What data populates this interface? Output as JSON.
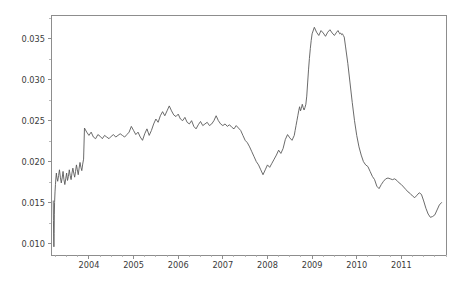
{
  "chart_data": {
    "type": "line",
    "title": "",
    "subtitle": "",
    "xlabel": "",
    "ylabel": "",
    "legend": [],
    "grid": false,
    "xlim": [
      2003.15,
      2012.0
    ],
    "ylim": [
      0.0086,
      0.0379
    ],
    "x_ticks": [
      2004,
      2005,
      2006,
      2007,
      2008,
      2009,
      2010,
      2011
    ],
    "x_tick_labels": [
      "2004",
      "2005",
      "2006",
      "2007",
      "2008",
      "2009",
      "2010",
      "2011"
    ],
    "x_minor_ticks_per_interval": 4,
    "y_ticks": [
      0.01,
      0.015,
      0.02,
      0.025,
      0.03,
      0.035
    ],
    "y_tick_labels": [
      "0.010",
      "0.015",
      "0.020",
      "0.025",
      "0.030",
      "0.035"
    ],
    "y_minor_ticks_per_interval": 2,
    "line_color": "#5a5a5a",
    "axis_color": "#8d8d8d",
    "background_color": "#ffffff",
    "series": [
      {
        "name": "series-1",
        "x": [
          2003.2,
          2003.205,
          2003.21,
          2003.215,
          2003.22,
          2003.225,
          2003.23,
          2003.24,
          2003.25,
          2003.26,
          2003.27,
          2003.28,
          2003.3,
          2003.32,
          2003.34,
          2003.36,
          2003.38,
          2003.4,
          2003.42,
          2003.44,
          2003.46,
          2003.48,
          2003.5,
          2003.52,
          2003.54,
          2003.56,
          2003.58,
          2003.6,
          2003.62,
          2003.64,
          2003.66,
          2003.68,
          2003.7,
          2003.72,
          2003.74,
          2003.76,
          2003.78,
          2003.8,
          2003.82,
          2003.84,
          2003.86,
          2003.88,
          2003.9,
          2003.95,
          2004.0,
          2004.05,
          2004.1,
          2004.15,
          2004.2,
          2004.25,
          2004.3,
          2004.35,
          2004.4,
          2004.45,
          2004.5,
          2004.55,
          2004.6,
          2004.65,
          2004.7,
          2004.75,
          2004.8,
          2004.85,
          2004.9,
          2004.95,
          2005.0,
          2005.05,
          2005.1,
          2005.15,
          2005.2,
          2005.25,
          2005.3,
          2005.35,
          2005.4,
          2005.45,
          2005.5,
          2005.55,
          2005.6,
          2005.65,
          2005.7,
          2005.75,
          2005.8,
          2005.85,
          2005.9,
          2005.95,
          2006.0,
          2006.05,
          2006.1,
          2006.15,
          2006.2,
          2006.25,
          2006.3,
          2006.35,
          2006.4,
          2006.45,
          2006.5,
          2006.55,
          2006.6,
          2006.65,
          2006.7,
          2006.75,
          2006.8,
          2006.85,
          2006.9,
          2006.95,
          2007.0,
          2007.05,
          2007.1,
          2007.15,
          2007.2,
          2007.25,
          2007.3,
          2007.35,
          2007.4,
          2007.45,
          2007.5,
          2007.55,
          2007.6,
          2007.65,
          2007.7,
          2007.75,
          2007.8,
          2007.85,
          2007.9,
          2007.95,
          2008.0,
          2008.05,
          2008.1,
          2008.15,
          2008.2,
          2008.25,
          2008.3,
          2008.35,
          2008.4,
          2008.45,
          2008.5,
          2008.55,
          2008.6,
          2008.62,
          2008.64,
          2008.66,
          2008.68,
          2008.7,
          2008.72,
          2008.74,
          2008.76,
          2008.78,
          2008.8,
          2008.82,
          2008.84,
          2008.86,
          2008.88,
          2008.9,
          2008.92,
          2008.94,
          2008.96,
          2008.98,
          2009.0,
          2009.05,
          2009.1,
          2009.15,
          2009.2,
          2009.25,
          2009.3,
          2009.35,
          2009.4,
          2009.45,
          2009.5,
          2009.55,
          2009.58,
          2009.6,
          2009.62,
          2009.64,
          2009.66,
          2009.68,
          2009.7,
          2009.72,
          2009.75,
          2009.8,
          2009.85,
          2009.9,
          2009.95,
          2010.0,
          2010.05,
          2010.1,
          2010.15,
          2010.2,
          2010.25,
          2010.3,
          2010.35,
          2010.4,
          2010.45,
          2010.5,
          2010.55,
          2010.6,
          2010.65,
          2010.7,
          2010.75,
          2010.8,
          2010.85,
          2010.9,
          2010.95,
          2011.0,
          2011.05,
          2011.1,
          2011.15,
          2011.2,
          2011.25,
          2011.3,
          2011.35,
          2011.4,
          2011.45,
          2011.5,
          2011.55,
          2011.6,
          2011.65,
          2011.7,
          2011.75,
          2011.8,
          2011.85,
          2011.9
        ],
        "y": [
          0.0152,
          0.0128,
          0.0108,
          0.0096,
          0.0112,
          0.0135,
          0.015,
          0.0163,
          0.0172,
          0.018,
          0.0186,
          0.0181,
          0.0176,
          0.0183,
          0.019,
          0.0181,
          0.0174,
          0.018,
          0.0188,
          0.0178,
          0.0172,
          0.0179,
          0.0186,
          0.0177,
          0.0182,
          0.019,
          0.0183,
          0.0178,
          0.0186,
          0.0192,
          0.0186,
          0.0181,
          0.0188,
          0.0196,
          0.019,
          0.0184,
          0.0192,
          0.0199,
          0.0193,
          0.0189,
          0.0197,
          0.0203,
          0.0241,
          0.0236,
          0.0232,
          0.0236,
          0.023,
          0.0228,
          0.0233,
          0.0231,
          0.0228,
          0.0232,
          0.023,
          0.0228,
          0.0231,
          0.0233,
          0.023,
          0.0232,
          0.0234,
          0.0232,
          0.023,
          0.0233,
          0.0236,
          0.0243,
          0.0238,
          0.0233,
          0.0236,
          0.023,
          0.0226,
          0.0234,
          0.024,
          0.0232,
          0.0238,
          0.0246,
          0.0252,
          0.0248,
          0.0256,
          0.0261,
          0.0256,
          0.0262,
          0.0268,
          0.0262,
          0.0257,
          0.0255,
          0.0258,
          0.0252,
          0.025,
          0.0254,
          0.0248,
          0.0246,
          0.025,
          0.0243,
          0.024,
          0.0245,
          0.0249,
          0.0244,
          0.0246,
          0.0248,
          0.0244,
          0.0246,
          0.025,
          0.0256,
          0.025,
          0.0246,
          0.0244,
          0.0246,
          0.0243,
          0.0245,
          0.0242,
          0.024,
          0.0244,
          0.0241,
          0.0238,
          0.0232,
          0.0226,
          0.0223,
          0.0218,
          0.0212,
          0.0206,
          0.02,
          0.0196,
          0.019,
          0.0184,
          0.019,
          0.0196,
          0.0193,
          0.0198,
          0.0203,
          0.0208,
          0.0214,
          0.021,
          0.0216,
          0.0227,
          0.0233,
          0.0229,
          0.0226,
          0.0232,
          0.0238,
          0.0244,
          0.025,
          0.0256,
          0.0262,
          0.0267,
          0.0262,
          0.0265,
          0.027,
          0.0266,
          0.0263,
          0.0266,
          0.027,
          0.028,
          0.0296,
          0.0312,
          0.0326,
          0.0338,
          0.0348,
          0.0356,
          0.0364,
          0.0358,
          0.0354,
          0.036,
          0.0357,
          0.0353,
          0.0358,
          0.0361,
          0.0357,
          0.0354,
          0.0358,
          0.036,
          0.0358,
          0.0356,
          0.0357,
          0.0355,
          0.0356,
          0.0354,
          0.0352,
          0.034,
          0.032,
          0.0296,
          0.0272,
          0.025,
          0.0232,
          0.0218,
          0.0208,
          0.02,
          0.0196,
          0.0194,
          0.0188,
          0.0182,
          0.0178,
          0.017,
          0.0167,
          0.0172,
          0.0176,
          0.0179,
          0.018,
          0.0179,
          0.0178,
          0.0179,
          0.0177,
          0.0174,
          0.0172,
          0.0169,
          0.0166,
          0.0163,
          0.0161,
          0.0158,
          0.0156,
          0.0159,
          0.0162,
          0.016,
          0.0152,
          0.0143,
          0.0136,
          0.0132,
          0.0133,
          0.0135,
          0.0141,
          0.0147,
          0.015
        ]
      }
    ]
  },
  "figure": {
    "plot_left_px": 51,
    "plot_right_px": 446,
    "plot_top_px": 15,
    "plot_bottom_px": 255
  }
}
